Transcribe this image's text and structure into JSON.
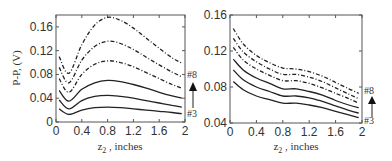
{
  "chart_data": [
    {
      "type": "line",
      "title": "",
      "xlabel": "z2 , inches",
      "ylabel": "P-P, (V)",
      "xlim": [
        0,
        2
      ],
      "ylim": [
        0,
        0.18
      ],
      "xticks": [
        "0",
        "0.4",
        "0.8",
        "1.2",
        "1.6",
        "2"
      ],
      "yticks": [
        "0",
        "0.04",
        "0.08",
        "0.12",
        "0.16"
      ],
      "grid": false,
      "annotation": {
        "top": "#8",
        "bottom": "#3",
        "arrow": "up"
      },
      "x": [
        0.05,
        0.2,
        0.4,
        0.6,
        0.8,
        1.0,
        1.2,
        1.4,
        1.6,
        1.8,
        1.95
      ],
      "series": [
        {
          "name": "#3",
          "style": "solid",
          "values": [
            0.022,
            0.013,
            0.02,
            0.024,
            0.025,
            0.024,
            0.022,
            0.02,
            0.018,
            0.016,
            0.014
          ]
        },
        {
          "name": "#4",
          "style": "solid",
          "values": [
            0.037,
            0.022,
            0.036,
            0.043,
            0.045,
            0.043,
            0.04,
            0.036,
            0.032,
            0.028,
            0.025
          ]
        },
        {
          "name": "#5",
          "style": "solid",
          "values": [
            0.053,
            0.035,
            0.055,
            0.066,
            0.07,
            0.068,
            0.063,
            0.057,
            0.05,
            0.044,
            0.04
          ]
        },
        {
          "name": "#6",
          "style": "dashdot",
          "values": [
            0.073,
            0.05,
            0.08,
            0.097,
            0.103,
            0.1,
            0.093,
            0.083,
            0.073,
            0.063,
            0.057
          ]
        },
        {
          "name": "#7",
          "style": "dashdot",
          "values": [
            0.092,
            0.066,
            0.104,
            0.127,
            0.136,
            0.132,
            0.122,
            0.109,
            0.096,
            0.084,
            0.076
          ]
        },
        {
          "name": "#8",
          "style": "dashdot",
          "values": [
            0.11,
            0.082,
            0.13,
            0.163,
            0.176,
            0.171,
            0.158,
            0.141,
            0.124,
            0.108,
            0.099
          ]
        }
      ]
    },
    {
      "type": "line",
      "title": "",
      "xlabel": "z2 , inches",
      "ylabel": "",
      "xlim": [
        0,
        2
      ],
      "ylim": [
        0.04,
        0.16
      ],
      "xticks": [
        "0",
        "0.4",
        "0.8",
        "1.2",
        "1.6",
        "2"
      ],
      "yticks": [
        "0.04",
        "0.08",
        "0.12",
        "0.16"
      ],
      "grid": false,
      "annotation": {
        "top": "#8",
        "bottom": "#3",
        "arrow": "up"
      },
      "x": [
        0.05,
        0.2,
        0.4,
        0.6,
        0.8,
        1.0,
        1.2,
        1.4,
        1.6,
        1.8,
        1.95
      ],
      "series": [
        {
          "name": "#3",
          "style": "solid",
          "values": [
            0.086,
            0.077,
            0.07,
            0.066,
            0.062,
            0.062,
            0.06,
            0.057,
            0.053,
            0.049,
            0.046
          ]
        },
        {
          "name": "#4",
          "style": "solid",
          "values": [
            0.099,
            0.088,
            0.08,
            0.075,
            0.07,
            0.07,
            0.068,
            0.064,
            0.059,
            0.054,
            0.051
          ]
        },
        {
          "name": "#5",
          "style": "solid",
          "values": [
            0.111,
            0.099,
            0.09,
            0.084,
            0.078,
            0.078,
            0.075,
            0.071,
            0.065,
            0.06,
            0.057
          ]
        },
        {
          "name": "#6",
          "style": "dashdot",
          "values": [
            0.124,
            0.11,
            0.1,
            0.093,
            0.087,
            0.087,
            0.084,
            0.079,
            0.073,
            0.067,
            0.062
          ]
        },
        {
          "name": "#7",
          "style": "dashdot",
          "values": [
            0.134,
            0.119,
            0.108,
            0.1,
            0.094,
            0.094,
            0.091,
            0.086,
            0.079,
            0.072,
            0.067
          ]
        },
        {
          "name": "#8",
          "style": "dashdot",
          "values": [
            0.145,
            0.128,
            0.115,
            0.107,
            0.101,
            0.1,
            0.097,
            0.092,
            0.085,
            0.078,
            0.073
          ]
        }
      ]
    }
  ],
  "labels": {
    "left": {
      "xlabel_main": "z",
      "xlabel_sub": "2",
      "xlabel_rest": " , inches",
      "ylabel": "P-P, (V)",
      "top_marker": "#8",
      "bottom_marker": "#3"
    },
    "right": {
      "xlabel_main": "z",
      "xlabel_sub": "2",
      "xlabel_rest": " , inches",
      "top_marker": "#8",
      "bottom_marker": "#3"
    }
  }
}
